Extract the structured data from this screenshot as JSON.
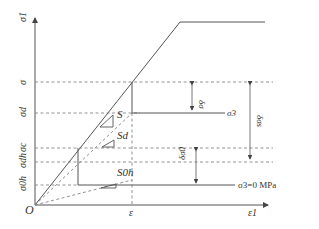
{
  "diagram": {
    "axes": {
      "y_label": "σ1",
      "x_label": "ε1",
      "origin_label": "O",
      "x_tick": "ε"
    },
    "y_levels": [
      {
        "key": "sigma",
        "label": "σ"
      },
      {
        "key": "sigma_d",
        "label": "σd"
      },
      {
        "key": "sigma_c",
        "label": "σc"
      },
      {
        "key": "sigma_dh",
        "label": "σdh"
      },
      {
        "key": "sigma_0h",
        "label": "σ0h"
      }
    ],
    "slopes": [
      {
        "label": "S"
      },
      {
        "label": "Sd"
      },
      {
        "label": "S0h"
      }
    ],
    "confining": {
      "upper": "σ3",
      "lower": "σ3=0 MPa"
    },
    "deltas": [
      {
        "label": "δσ"
      },
      {
        "label": "δσs"
      },
      {
        "label": "δσ0"
      }
    ]
  }
}
